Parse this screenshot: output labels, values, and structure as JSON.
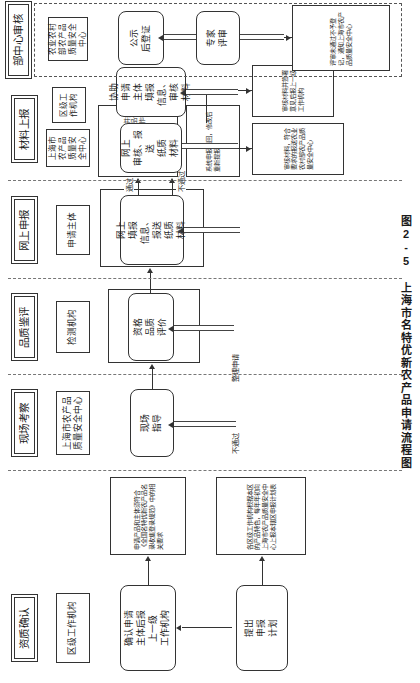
{
  "figure": {
    "caption": "图2-5  上海市名特优新农产品申请流程图",
    "orientation": "rotated-90"
  },
  "stages": [
    {
      "id": "stage-ministry-review",
      "title": "部中心审核",
      "org": "农业农村部农产品质量安全中心",
      "nodes": [
        {
          "id": "node-publicity",
          "label": "公示\n后登证"
        },
        {
          "id": "node-expert-review",
          "label": "专家\n评审"
        }
      ],
      "notes": [
        {
          "id": "note-review-failed",
          "text": "评审未通过不予登记，通知上海市农产品质量安全中心"
        }
      ]
    },
    {
      "id": "stage-material-report",
      "title": "材料上报",
      "org_top": "上海市农产品质量安全中心",
      "org_bottom": "区级工作机构",
      "nodes": [
        {
          "id": "node-online-audit",
          "label": "网上\n审核、报送\n纸质\n材料"
        },
        {
          "id": "node-assist-fill",
          "label": "协助\n申请\n主体\n填报\n信息、\n审核\n材料"
        }
      ],
      "notes": [
        {
          "id": "note-audit-pass-forward",
          "text": "审核材料，符合要求的报送农业农村部农产品质量安全中心"
        },
        {
          "id": "note-audit-sign-forward",
          "text": "审核材料并签署意见后报上一级工作机构"
        }
      ]
    },
    {
      "id": "stage-online-declare",
      "title": "网上申报",
      "org": "申请主体",
      "nodes": [
        {
          "id": "node-fill-submit",
          "label": "网上\n填报\n信息、\n报送\n纸质\n材料"
        }
      ],
      "edge_labels": {
        "pass": "通过",
        "fail": "不通过"
      },
      "notes": [
        {
          "id": "note-pass-download",
          "text": "符合的，网上下载并打印申请材料，与样品一起报送至上一级工作机构"
        },
        {
          "id": "note-fail-return",
          "text": "系统申报退回，修改后重新提报"
        }
      ]
    },
    {
      "id": "stage-quality-appraisal",
      "title": "品质鉴评",
      "org": "检测机构",
      "nodes": [
        {
          "id": "node-quality-eval",
          "label": "资格\n品质\n评价"
        }
      ],
      "notes": [
        {
          "id": "note-quality-standard",
          "text": "申请主体须登录全国名特优新农产品平台（全国名特优新农产品官网 http://www.nptpm.com），系统鉴定结果对产品品质进行鉴定"
        }
      ]
    },
    {
      "id": "stage-onsite-inspection",
      "title": "现场考察",
      "org": "上海市农产品质量安全中心",
      "nodes": [
        {
          "id": "node-onsite-guide",
          "label": "现场\n指导"
        }
      ],
      "edge_labels": {
        "fail": "不通过",
        "retry": "整理申请"
      },
      "notes": [
        {
          "id": "note-onsite-content",
          "text": "主要考察基地环境状况、生产区域、生产管理、质量控制措施、规模化生产能力、品牌影响力和市场销售情况等"
        }
      ]
    },
    {
      "id": "stage-qualification",
      "title": "资质确认",
      "org": "区级工作机构",
      "nodes": [
        {
          "id": "node-confirm-applicant",
          "label": "确认申请\n主体后报\n上一级\n工作机构"
        },
        {
          "id": "node-submit-plan",
          "label": "提出\n申报\n计划"
        }
      ],
      "notes": [
        {
          "id": "note-applicant-requirement",
          "text": "申请产品和主体须符合《全国名特优新农产品名录收集登录规范》中的相关要求"
        },
        {
          "id": "note-plan-requirement",
          "text": "各区级工作机构根据本区的产品特色，每年年初向上海市农产品质量安全中心上报本辖区申报计划表"
        }
      ]
    }
  ]
}
